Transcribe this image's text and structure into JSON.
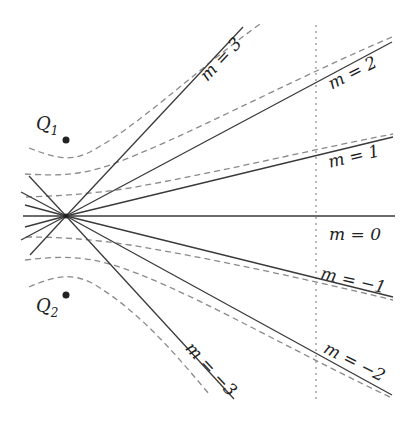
{
  "diagram": {
    "charges": [
      {
        "label": "Q",
        "subscript": "1",
        "x": 66,
        "y": 140
      },
      {
        "label": "Q",
        "subscript": "2",
        "x": 66,
        "y": 295
      }
    ],
    "origin": {
      "x": 66,
      "y": 216
    },
    "lines": [
      {
        "m": "3",
        "label": "m = 3",
        "x2": 243,
        "y2": 27,
        "xl": 225,
        "yl": 63,
        "rot": -47
      },
      {
        "m": "2",
        "label": "m = 2",
        "x2": 392,
        "y2": 42,
        "xl": 355,
        "yl": 78,
        "rot": -27
      },
      {
        "m": "1",
        "label": "m = 1",
        "x2": 393,
        "y2": 137,
        "xl": 355,
        "yl": 162,
        "rot": -13
      },
      {
        "m": "0",
        "label": "m = 0",
        "x2": 395,
        "y2": 216,
        "xl": 355,
        "yl": 240,
        "rot": 0
      },
      {
        "m": "-1",
        "label": "m = −1",
        "x2": 393,
        "y2": 297,
        "xl": 352,
        "yl": 286,
        "rot": 13
      },
      {
        "m": "-2",
        "label": "m = −2",
        "x2": 392,
        "y2": 395,
        "xl": 352,
        "yl": 367,
        "rot": 27
      },
      {
        "m": "-3",
        "label": "m = −3",
        "x2": 234,
        "y2": 399,
        "xl": 207,
        "yl": 373,
        "rot": 47
      }
    ],
    "vertical_line_x": 316
  }
}
